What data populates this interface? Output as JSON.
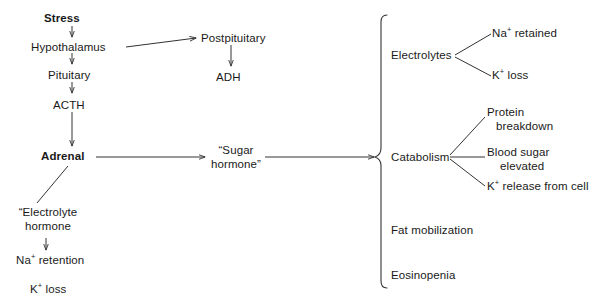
{
  "diagram": {
    "stroke_color": "#333333",
    "text_color": "#1a1a1a",
    "background": "#ffffff",
    "left_chain": {
      "stress": "Stress",
      "hypothalamus": "Hypothalamus",
      "pituitary": "Pituitary",
      "acth": "ACTH",
      "adrenal": "Adrenal"
    },
    "posterior_branch": {
      "postpituitary": "Postpituitary",
      "adh": "ADH"
    },
    "electrolyte_branch": {
      "hormone_line1": "“Electrolyte",
      "hormone_line2": "hormone",
      "na_retention_pre": "Na",
      "na_retention_sup": "+",
      "na_retention_post": " retention",
      "k_loss_pre": "K",
      "k_loss_sup": "+",
      "k_loss_post": " loss"
    },
    "sugar_hormone": {
      "line1": "“Sugar",
      "line2": "hormone”"
    },
    "effects": {
      "electrolytes_label": "Electrolytes",
      "na_retained_pre": "Na",
      "na_retained_sup": "+",
      "na_retained_post": " retained",
      "k_loss_pre": "K",
      "k_loss_sup": "+",
      "k_loss_post": " loss",
      "catabolism_label": "Catabolism",
      "protein_breakdown_line1": "Protein",
      "protein_breakdown_line2": "breakdown",
      "blood_sugar_line1": "Blood sugar",
      "blood_sugar_line2": "elevated",
      "k_release_pre": "K",
      "k_release_sup": "+",
      "k_release_post": " release from cell",
      "fat_mobilization": "Fat mobilization",
      "eosinopenia": "Eosinopenia"
    }
  }
}
